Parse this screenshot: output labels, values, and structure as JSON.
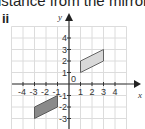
{
  "text": {
    "caption": "istance from the mirror",
    "part_label": "ii"
  },
  "diagram": {
    "type": "coordinate-grid",
    "x_axis_label": "x",
    "y_axis_label": "y",
    "x_ticks": [
      "-4",
      "-3",
      "-2",
      "-1",
      "1",
      "2",
      "3",
      "4"
    ],
    "y_ticks": [
      "4",
      "3",
      "2",
      "1",
      "-1",
      "-2",
      "-3"
    ],
    "origin_label": "0",
    "shapes": [
      {
        "name": "original-parallelogram",
        "vertices": [
          [
            1,
            1
          ],
          [
            1,
            2
          ],
          [
            3,
            3
          ],
          [
            3,
            2
          ]
        ],
        "fill": "#d9d9d9"
      },
      {
        "name": "image-parallelogram",
        "vertices": [
          [
            -1,
            -1
          ],
          [
            -1,
            -2
          ],
          [
            -3,
            -3
          ],
          [
            -3,
            -2
          ]
        ],
        "fill": "#8a8a8a"
      }
    ]
  },
  "colors": {
    "grid": "#dcdcdc",
    "axis": "#333333",
    "text": "#222222"
  }
}
